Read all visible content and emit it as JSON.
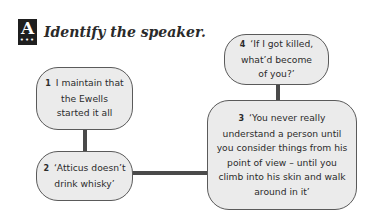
{
  "header": {
    "badge_letter": "A",
    "badge_dots": "•••",
    "title": "Identify the speaker."
  },
  "quotes": [
    {
      "number": "1",
      "text": "I maintain that the Ewells started it all"
    },
    {
      "number": "2",
      "text": "‘Atticus doesn’t drink whisky’"
    },
    {
      "number": "3",
      "text": "‘You never really understand a person until you consider things from his point of view – until you climb into his skin and walk around in it’"
    },
    {
      "number": "4",
      "text": "‘If I got killed, what’d become of you?’"
    }
  ],
  "colors": {
    "box_fill": "#ebebeb",
    "box_border": "#5a5a5a",
    "connector": "#4a4a4a",
    "badge": "#1f1f1f"
  }
}
